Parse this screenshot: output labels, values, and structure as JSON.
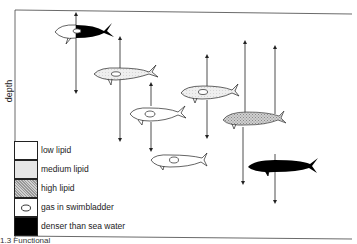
{
  "figure": {
    "y_axis_label": "depth",
    "caption_fragment": "1.3  Functional",
    "colors": {
      "low_lipid": "#ffffff",
      "medium_lipid": "#e6e6e6",
      "high_lipid": "#bdbdbd",
      "dense": "#000000",
      "line": "#222222"
    }
  },
  "legend": {
    "items": [
      {
        "key": "low_lipid",
        "label": "low lipid"
      },
      {
        "key": "medium_lipid",
        "label": "medium lipid"
      },
      {
        "key": "high_lipid",
        "label": "high lipid"
      },
      {
        "key": "gas",
        "label": "gas in swimbladder"
      },
      {
        "key": "dense",
        "label": "denser than sea water"
      }
    ]
  },
  "fish": [
    {
      "id": "fish-1",
      "body": "low_lipid",
      "tail": "dense",
      "swimbladder": true,
      "x": 55,
      "y": 30,
      "arrow_up": 10,
      "arrow_down": 92
    },
    {
      "id": "fish-2",
      "body": "medium_lipid",
      "swimbladder": true,
      "x": 95,
      "y": 73,
      "arrow_up": 38,
      "arrow_down": 140
    },
    {
      "id": "fish-3",
      "body": "low_lipid",
      "swimbladder": true,
      "x": 130,
      "y": 113,
      "arrow_up": 83,
      "arrow_down": 150
    },
    {
      "id": "fish-4",
      "body": "medium_lipid",
      "swimbladder": true,
      "x": 181,
      "y": 93,
      "arrow_up": 56,
      "arrow_down": 137
    },
    {
      "id": "fish-5",
      "body": "low_lipid",
      "swimbladder": true,
      "x": 151,
      "y": 160,
      "arrow_up": null,
      "arrow_down": null
    },
    {
      "id": "fish-6",
      "body": "high_lipid",
      "swimbladder": false,
      "x": 222,
      "y": 118,
      "arrow_up": 42,
      "arrow_down": 183
    },
    {
      "id": "fish-7",
      "body": "dense",
      "swimbladder": false,
      "x": 248,
      "y": 165,
      "arrow_up": 47,
      "arrow_down": 202
    }
  ]
}
